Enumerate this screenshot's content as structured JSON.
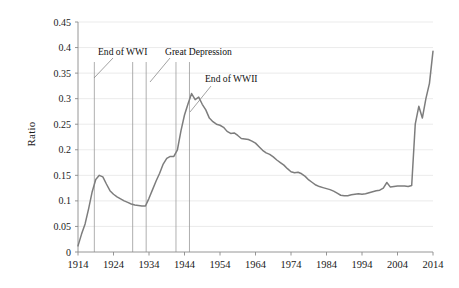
{
  "chart_data": {
    "type": "line",
    "title": "",
    "xlabel": "",
    "ylabel": "Ratio",
    "xlim": [
      1914,
      2014
    ],
    "ylim": [
      0,
      0.45
    ],
    "grid": true,
    "legend": "none",
    "y_ticks": [
      "0",
      "0.05",
      "0.1",
      "0.15",
      "0.2",
      "0.25",
      "0.3",
      "0.35",
      "0.4",
      "0.45"
    ],
    "y_tick_values": [
      0,
      0.05,
      0.1,
      0.15,
      0.2,
      0.25,
      0.3,
      0.35,
      0.4,
      0.45
    ],
    "x_ticks": [
      "1914",
      "1924",
      "1934",
      "1944",
      "1954",
      "1964",
      "1974",
      "1984",
      "1994",
      "2004",
      "2014"
    ],
    "x_tick_values": [
      1914,
      1924,
      1934,
      1944,
      1954,
      1964,
      1974,
      1984,
      1994,
      2004,
      2014
    ],
    "series": [
      {
        "name": "Ratio",
        "color": "#7d7d7d",
        "x": [
          1914,
          1915,
          1916,
          1917,
          1918,
          1919,
          1920,
          1921,
          1922,
          1923,
          1924,
          1925,
          1926,
          1927,
          1928,
          1929,
          1930,
          1931,
          1932,
          1933,
          1934,
          1935,
          1936,
          1937,
          1938,
          1939,
          1940,
          1941,
          1942,
          1943,
          1944,
          1945,
          1946,
          1947,
          1948,
          1949,
          1950,
          1951,
          1952,
          1953,
          1954,
          1955,
          1956,
          1957,
          1958,
          1959,
          1960,
          1961,
          1962,
          1963,
          1964,
          1965,
          1966,
          1967,
          1968,
          1969,
          1970,
          1971,
          1972,
          1973,
          1974,
          1975,
          1976,
          1977,
          1978,
          1979,
          1980,
          1981,
          1982,
          1983,
          1984,
          1985,
          1986,
          1987,
          1988,
          1989,
          1990,
          1991,
          1992,
          1993,
          1994,
          1995,
          1996,
          1997,
          1998,
          1999,
          2000,
          2001,
          2002,
          2003,
          2004,
          2005,
          2006,
          2007,
          2008,
          2009,
          2010,
          2011,
          2012,
          2013,
          2014
        ],
        "y": [
          0.012,
          0.035,
          0.055,
          0.085,
          0.118,
          0.142,
          0.15,
          0.147,
          0.133,
          0.12,
          0.113,
          0.108,
          0.104,
          0.1,
          0.097,
          0.094,
          0.092,
          0.091,
          0.09,
          0.09,
          0.105,
          0.122,
          0.139,
          0.154,
          0.172,
          0.183,
          0.187,
          0.187,
          0.2,
          0.237,
          0.268,
          0.29,
          0.31,
          0.298,
          0.303,
          0.289,
          0.278,
          0.262,
          0.255,
          0.25,
          0.248,
          0.244,
          0.236,
          0.232,
          0.233,
          0.228,
          0.222,
          0.221,
          0.22,
          0.217,
          0.213,
          0.206,
          0.199,
          0.194,
          0.191,
          0.186,
          0.18,
          0.175,
          0.17,
          0.163,
          0.157,
          0.155,
          0.156,
          0.153,
          0.148,
          0.141,
          0.136,
          0.131,
          0.128,
          0.126,
          0.124,
          0.122,
          0.119,
          0.115,
          0.111,
          0.11,
          0.11,
          0.112,
          0.113,
          0.114,
          0.113,
          0.114,
          0.116,
          0.118,
          0.12,
          0.121,
          0.125,
          0.136,
          0.127,
          0.128,
          0.129,
          0.129,
          0.129,
          0.128,
          0.13,
          0.25,
          0.285,
          0.262,
          0.3,
          0.33,
          0.393
        ]
      }
    ],
    "vertical_markers": [
      {
        "name": "wwi-end-marker",
        "x": 1918.6,
        "color": "#9a9a9a"
      },
      {
        "name": "great-depression-start-marker",
        "x": 1929.4,
        "color": "#9a9a9a"
      },
      {
        "name": "great-depression-end-marker",
        "x": 1933.2,
        "color": "#9a9a9a"
      },
      {
        "name": "wwii-start-marker",
        "x": 1941.6,
        "color": "#9a9a9a"
      },
      {
        "name": "wwii-end-marker",
        "x": 1945.4,
        "color": "#9a9a9a"
      }
    ],
    "annotations": [
      {
        "name": "annotation-end-of-wwi",
        "label": "End of WWI",
        "text_x": 98,
        "text_y": 55,
        "leader": {
          "x1": 94,
          "y1": 78,
          "x2": 113,
          "y2": 58
        }
      },
      {
        "name": "annotation-great-depression",
        "label": "Great Depression",
        "text_x": 165,
        "text_y": 55,
        "leader": {
          "x1": 150,
          "y1": 82,
          "x2": 170,
          "y2": 58
        }
      },
      {
        "name": "annotation-end-of-wwii",
        "label": "End of WWII",
        "text_x": 205,
        "text_y": 82,
        "leader": {
          "x1": 190,
          "y1": 112,
          "x2": 211,
          "y2": 86
        }
      }
    ]
  }
}
